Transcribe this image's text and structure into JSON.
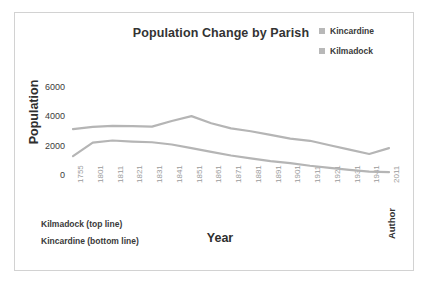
{
  "chart_data": {
    "type": "line",
    "title": "Population Change by Parish",
    "xlabel": "Year",
    "ylabel": "Population",
    "ylim": [
      0,
      6000
    ],
    "yticks": [
      0,
      2000,
      4000,
      6000
    ],
    "grid": false,
    "legend_position": "top-right",
    "categories": [
      "1755",
      "1801",
      "1811",
      "1821",
      "1831",
      "1841",
      "1851",
      "1861",
      "1871",
      "1881",
      "1891",
      "1901",
      "1911",
      "1921",
      "1931",
      "1941",
      "2011"
    ],
    "series": [
      {
        "name": "Kilmadock",
        "note": "top line",
        "color": "#b5b5b5",
        "values": [
          3200,
          3350,
          3420,
          3400,
          3370,
          3750,
          4080,
          3600,
          3250,
          3050,
          2800,
          2550,
          2400,
          2100,
          1800,
          1500,
          1900
        ]
      },
      {
        "name": "Kincardine",
        "note": "bottom line",
        "color": "#b5b5b5",
        "values": [
          1350,
          2280,
          2420,
          2350,
          2300,
          2150,
          1900,
          1650,
          1400,
          1200,
          1020,
          880,
          700,
          560,
          420,
          300,
          260
        ]
      }
    ],
    "annotations": [
      "Kilmadock (top line)",
      "Kincardine (bottom line)"
    ],
    "credit": "Author"
  },
  "legend": {
    "items": [
      {
        "label": "Kincardine",
        "color": "#b8b8b8"
      },
      {
        "label": "Kilmadock",
        "color": "#b8b8b8"
      }
    ]
  },
  "colors": {
    "frame_border": "#d2d2d2",
    "title_text": "#333333",
    "tick_text": "#9b9b9b",
    "line": "#b5b5b5"
  }
}
